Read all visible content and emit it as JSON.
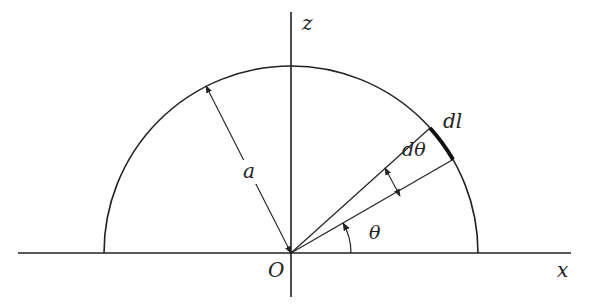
{
  "diagram": {
    "labels": {
      "z_axis": "z",
      "x_axis": "x",
      "origin": "O",
      "radius": "a",
      "arc_element": "dl",
      "angle_element": "dθ",
      "angle": "θ"
    },
    "geometry": {
      "origin": [
        291,
        253
      ],
      "radius_px": 187,
      "theta_deg": 30,
      "dtheta_deg": 12,
      "radius_arrow_angle_deg": 117
    },
    "colors": {
      "stroke": "#222222",
      "background": "#ffffff"
    }
  }
}
